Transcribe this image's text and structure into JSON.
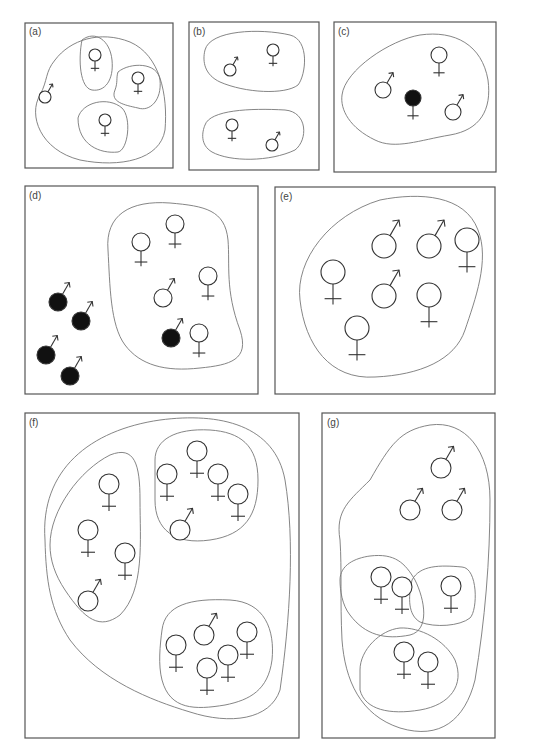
{
  "figure": {
    "panels": [
      {
        "id": "a",
        "label": "(a)",
        "box": [
          25,
          23,
          148,
          145
        ],
        "blobs": [
          "M40,95 C28,115 40,150 80,160 C120,168 160,160 165,130 C168,95 160,55 130,42 C100,30 70,40 55,60 C45,72 48,80 40,95 Z",
          "M82,40 C95,30 110,40 112,60 C114,80 105,92 92,90 C80,88 78,60 82,40 Z",
          "M118,72 C130,62 158,62 160,80 C162,100 150,112 138,108 C124,105 110,102 115,90 C118,82 116,78 118,72 Z",
          "M78,118 C82,102 108,96 122,108 C132,118 128,150 118,152 C100,154 78,145 78,118 Z"
        ],
        "symbols": [
          {
            "type": "male",
            "x": 45,
            "y": 97,
            "r": 6,
            "filled": false
          },
          {
            "type": "female",
            "x": 95,
            "y": 55,
            "r": 6,
            "filled": false
          },
          {
            "type": "female",
            "x": 138,
            "y": 78,
            "r": 6,
            "filled": false
          },
          {
            "type": "female",
            "x": 105,
            "y": 120,
            "r": 6,
            "filled": false
          }
        ]
      },
      {
        "id": "b",
        "label": "(b)",
        "box": [
          189,
          22,
          130,
          148
        ],
        "blobs": [
          "M205,50 C210,30 260,28 290,35 C310,40 306,75 298,85 C285,95 245,93 220,82 C205,75 202,62 205,50 Z",
          "M205,125 C210,110 250,108 285,110 C308,112 308,140 295,150 C270,162 230,162 212,152 C200,145 202,132 205,125 Z"
        ],
        "symbols": [
          {
            "type": "male",
            "x": 230,
            "y": 70,
            "r": 6,
            "filled": false
          },
          {
            "type": "female",
            "x": 273,
            "y": 50,
            "r": 6,
            "filled": false
          },
          {
            "type": "female",
            "x": 232,
            "y": 125,
            "r": 6,
            "filled": false
          },
          {
            "type": "male",
            "x": 272,
            "y": 145,
            "r": 6,
            "filled": false
          }
        ]
      },
      {
        "id": "c",
        "label": "(c)",
        "box": [
          334,
          22,
          162,
          150
        ],
        "blobs": [
          "M342,95 C345,70 390,40 420,35 C455,30 482,45 488,80 C492,110 480,130 450,135 C420,140 395,150 375,140 C350,128 340,110 342,95 Z"
        ],
        "symbols": [
          {
            "type": "male",
            "x": 383,
            "y": 90,
            "r": 8,
            "filled": false
          },
          {
            "type": "female",
            "x": 439,
            "y": 55,
            "r": 8,
            "filled": false
          },
          {
            "type": "female",
            "x": 413,
            "y": 98,
            "r": 8,
            "filled": true
          },
          {
            "type": "male",
            "x": 453,
            "y": 112,
            "r": 8,
            "filled": false
          }
        ]
      },
      {
        "id": "d",
        "label": "(d)",
        "box": [
          25,
          186,
          233,
          208
        ],
        "blobs": [
          "M108,250 C105,215 130,200 170,203 C205,206 225,210 228,240 C230,265 225,290 240,330 C250,360 230,365 200,368 C165,372 140,365 125,345 C110,325 110,285 108,250 Z"
        ],
        "symbols": [
          {
            "type": "male",
            "x": 58,
            "y": 302,
            "r": 9,
            "filled": true
          },
          {
            "type": "male",
            "x": 81,
            "y": 321,
            "r": 9,
            "filled": true
          },
          {
            "type": "male",
            "x": 46,
            "y": 355,
            "r": 9,
            "filled": true
          },
          {
            "type": "male",
            "x": 70,
            "y": 376,
            "r": 9,
            "filled": true
          },
          {
            "type": "female",
            "x": 141,
            "y": 242,
            "r": 9,
            "filled": false
          },
          {
            "type": "female",
            "x": 175,
            "y": 224,
            "r": 9,
            "filled": false
          },
          {
            "type": "male",
            "x": 163,
            "y": 298,
            "r": 9,
            "filled": false
          },
          {
            "type": "female",
            "x": 208,
            "y": 276,
            "r": 9,
            "filled": false
          },
          {
            "type": "male",
            "x": 171,
            "y": 338,
            "r": 9,
            "filled": true
          },
          {
            "type": "female",
            "x": 199,
            "y": 333,
            "r": 9,
            "filled": false
          }
        ]
      },
      {
        "id": "e",
        "label": "(e)",
        "box": [
          275,
          187,
          220,
          207
        ],
        "blobs": [
          "M300,300 C295,260 330,215 380,200 C420,192 465,195 478,230 C490,260 475,300 465,330 C455,360 420,375 375,377 C330,380 305,345 300,300 Z"
        ],
        "symbols": [
          {
            "type": "male",
            "x": 384,
            "y": 246,
            "r": 12,
            "filled": false
          },
          {
            "type": "male",
            "x": 429,
            "y": 246,
            "r": 12,
            "filled": false
          },
          {
            "type": "female",
            "x": 467,
            "y": 240,
            "r": 12,
            "filled": false
          },
          {
            "type": "female",
            "x": 333,
            "y": 272,
            "r": 12,
            "filled": false
          },
          {
            "type": "male",
            "x": 384,
            "y": 296,
            "r": 12,
            "filled": false
          },
          {
            "type": "female",
            "x": 429,
            "y": 295,
            "r": 12,
            "filled": false
          },
          {
            "type": "female",
            "x": 357,
            "y": 328,
            "r": 12,
            "filled": false
          }
        ]
      },
      {
        "id": "f",
        "label": "(f)",
        "box": [
          25,
          413,
          274,
          325
        ],
        "blobs": [
          "M45,540 C40,470 90,430 160,420 C220,412 275,425 285,480 C295,540 290,620 280,690 C270,720 230,725 190,712 C150,700 100,680 70,640 C50,610 46,580 45,540 Z",
          "M50,545 C50,510 80,470 110,455 C135,445 140,465 140,500 C140,540 145,590 120,615 C100,630 85,620 65,590 C55,575 50,560 50,545 Z",
          "M155,460 C155,440 175,428 210,430 C240,432 258,445 258,480 C258,515 245,535 210,540 C175,545 155,530 155,500 Z",
          "M162,630 C165,605 190,598 230,600 C265,602 275,630 272,660 C268,690 250,700 225,705 C195,710 170,710 162,680 C158,665 160,645 162,630 Z"
        ],
        "symbols": [
          {
            "type": "female",
            "x": 109,
            "y": 484,
            "r": 10,
            "filled": false
          },
          {
            "type": "female",
            "x": 88,
            "y": 530,
            "r": 10,
            "filled": false
          },
          {
            "type": "female",
            "x": 125,
            "y": 553,
            "r": 10,
            "filled": false
          },
          {
            "type": "male",
            "x": 88,
            "y": 601,
            "r": 10,
            "filled": false
          },
          {
            "type": "female",
            "x": 167,
            "y": 474,
            "r": 10,
            "filled": false
          },
          {
            "type": "female",
            "x": 197,
            "y": 451,
            "r": 10,
            "filled": false
          },
          {
            "type": "female",
            "x": 218,
            "y": 474,
            "r": 10,
            "filled": false
          },
          {
            "type": "female",
            "x": 238,
            "y": 494,
            "r": 10,
            "filled": false
          },
          {
            "type": "male",
            "x": 180,
            "y": 530,
            "r": 10,
            "filled": false
          },
          {
            "type": "female",
            "x": 176,
            "y": 645,
            "r": 10,
            "filled": false
          },
          {
            "type": "male",
            "x": 204,
            "y": 635,
            "r": 10,
            "filled": false
          },
          {
            "type": "female",
            "x": 247,
            "y": 632,
            "r": 10,
            "filled": false
          },
          {
            "type": "female",
            "x": 228,
            "y": 655,
            "r": 10,
            "filled": false
          },
          {
            "type": "female",
            "x": 207,
            "y": 668,
            "r": 10,
            "filled": false
          }
        ]
      },
      {
        "id": "g",
        "label": "(g)",
        "box": [
          322,
          413,
          173,
          325
        ],
        "blobs": [
          "M340,540 C335,510 350,500 370,480 C390,445 400,430 430,425 C465,420 490,450 490,500 C490,560 485,620 475,680 C465,720 440,740 400,728 C360,715 345,680 342,640 C340,600 342,570 340,540 Z",
          "M340,580 C340,565 355,558 370,556 C395,553 405,563 415,580 C425,600 430,630 410,635 C385,640 365,635 350,615 C342,605 340,590 340,580 Z",
          "M412,580 C420,565 440,565 462,567 C478,568 478,610 470,618 C460,626 435,628 420,622 C408,615 408,598 412,580 Z",
          "M360,670 C360,650 380,630 400,628 C420,627 445,640 455,660 C465,685 450,705 420,710 C390,715 365,710 360,690 Z"
        ],
        "symbols": [
          {
            "type": "male",
            "x": 441,
            "y": 468,
            "r": 10,
            "filled": false
          },
          {
            "type": "male",
            "x": 410,
            "y": 510,
            "r": 10,
            "filled": false
          },
          {
            "type": "male",
            "x": 452,
            "y": 510,
            "r": 10,
            "filled": false
          },
          {
            "type": "female",
            "x": 381,
            "y": 577,
            "r": 10,
            "filled": false
          },
          {
            "type": "female",
            "x": 402,
            "y": 587,
            "r": 10,
            "filled": false
          },
          {
            "type": "female",
            "x": 451,
            "y": 586,
            "r": 10,
            "filled": false
          },
          {
            "type": "female",
            "x": 404,
            "y": 652,
            "r": 10,
            "filled": false
          },
          {
            "type": "female",
            "x": 428,
            "y": 662,
            "r": 10,
            "filled": false
          }
        ]
      }
    ],
    "colors": {
      "frame": "#555555",
      "blob": "#777777",
      "symbol_stroke": "#333333",
      "filled": "#111111",
      "background": "#ffffff"
    }
  }
}
